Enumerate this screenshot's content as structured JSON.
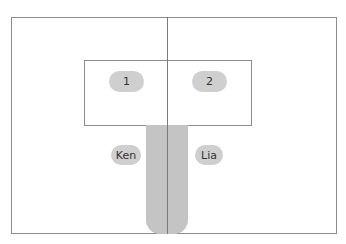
{
  "diagram": {
    "colors": {
      "stroke": "#8c8c8c",
      "center_line": "#7a7a7a",
      "pill_fill": "#cfcfcf",
      "bar_fill": "#c4c4c4",
      "text": "#333333"
    },
    "labels": {
      "left_box": "1",
      "right_box": "2",
      "left_person": "Ken",
      "right_person": "Lia"
    }
  }
}
